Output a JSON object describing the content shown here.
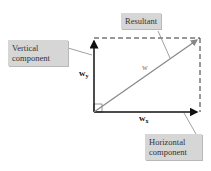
{
  "callouts": {
    "resultant": "Resultant",
    "vertical_line1": "Vertical",
    "vertical_line2": "component",
    "horizontal_line1": "Horizontal",
    "horizontal_line2": "component"
  },
  "labels": {
    "wy_base": "w",
    "wy_sub": "y",
    "wx_base": "w",
    "wx_sub": "x",
    "w": "w"
  },
  "colors": {
    "callout_bg": "#d6d6d6",
    "vector_black": "#111111",
    "resultant_gray": "#888888"
  }
}
